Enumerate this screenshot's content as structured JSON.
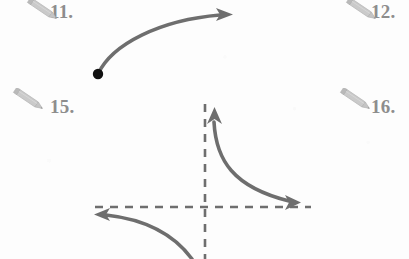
{
  "page": {
    "background_color": "#fdfdfd",
    "width": 409,
    "height": 259
  },
  "colors": {
    "curve_stroke": "#6e6e6e",
    "asymptote_stroke": "#6e6e6e",
    "label_text": "#8d8d8d",
    "pencil_body": "#c9c9c9",
    "pencil_outline": "#b3b3b3",
    "point_dot": "#111111"
  },
  "exercises": [
    {
      "number_label": "11.",
      "icon": "pencil-icon",
      "position": {
        "x": 50,
        "y": 2
      },
      "pencil_position": {
        "x": 24,
        "y": 0
      }
    },
    {
      "number_label": "12.",
      "icon": "pencil-icon",
      "position": {
        "x": 371,
        "y": 2
      },
      "pencil_position": {
        "x": 343,
        "y": 0
      }
    },
    {
      "number_label": "15.",
      "icon": "pencil-icon",
      "position": {
        "x": 50,
        "y": 97
      },
      "pencil_position": {
        "x": 10,
        "y": 88
      }
    },
    {
      "number_label": "16.",
      "icon": "pencil-icon",
      "position": {
        "x": 371,
        "y": 97
      },
      "pencil_position": {
        "x": 337,
        "y": 88
      }
    }
  ],
  "figures": [
    {
      "name": "increasing-curve-with-endpoint",
      "description": "Concave-down curve rising from a solid endpoint to an arrow at upper right",
      "endpoint_dot": {
        "x": 98,
        "y": 74,
        "radius": 5,
        "filled": true
      },
      "path": "M98,74 C112,44 160,20 222,15",
      "arrow_head": {
        "x": 230,
        "y": 14,
        "direction": "right"
      },
      "stroke_width": 3.4
    },
    {
      "name": "hyperbola-with-asymptotes",
      "description": "Reciprocal-type graph with vertical and horizontal dashed asymptotes and two arrowed branches",
      "vertical_asymptote": {
        "x": 205,
        "y1": 104,
        "y2": 259,
        "dash": "7 6"
      },
      "horizontal_asymptote": {
        "y": 207,
        "x1": 95,
        "x2": 311,
        "dash": "7 6"
      },
      "branch_upper_right": {
        "path": "M215,120 C217,158 232,186 290,201",
        "arrow_start": {
          "x": 214,
          "y": 110,
          "direction": "up"
        },
        "arrow_end": {
          "x": 299,
          "y": 203,
          "direction": "right"
        }
      },
      "branch_lower_left": {
        "path": "M104,215 C140,219 172,232 192,259",
        "arrow_start": {
          "x": 95,
          "y": 214,
          "direction": "left"
        }
      },
      "stroke_width": 3.4
    }
  ]
}
